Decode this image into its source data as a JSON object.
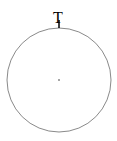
{
  "diagram": {
    "circle": {
      "cx": 59,
      "cy": 80,
      "r": 52,
      "stroke": "#8a8a8a"
    },
    "center_point": {
      "cx": 59,
      "cy": 80,
      "color": "#888888"
    },
    "top_marker": {
      "x": 59,
      "y": 28,
      "color": "#000000"
    },
    "top_label": "T"
  }
}
